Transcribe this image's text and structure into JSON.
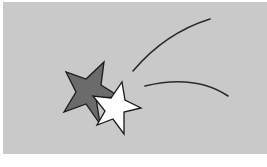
{
  "scene": {
    "description": "Shooting star clip-art: dark gray star and white star with two curved trail lines on a light gray background",
    "background_color": "#c9c9c9",
    "margin_color": "#ffffff"
  },
  "shapes": {
    "dark_star": {
      "fill": "#6b6b6b",
      "stroke": "#1a1a1a"
    },
    "white_star": {
      "fill": "#ffffff",
      "stroke": "#1a1a1a"
    },
    "trail_upper": {
      "stroke": "#2a2a2a"
    },
    "trail_lower": {
      "stroke": "#2a2a2a"
    }
  }
}
